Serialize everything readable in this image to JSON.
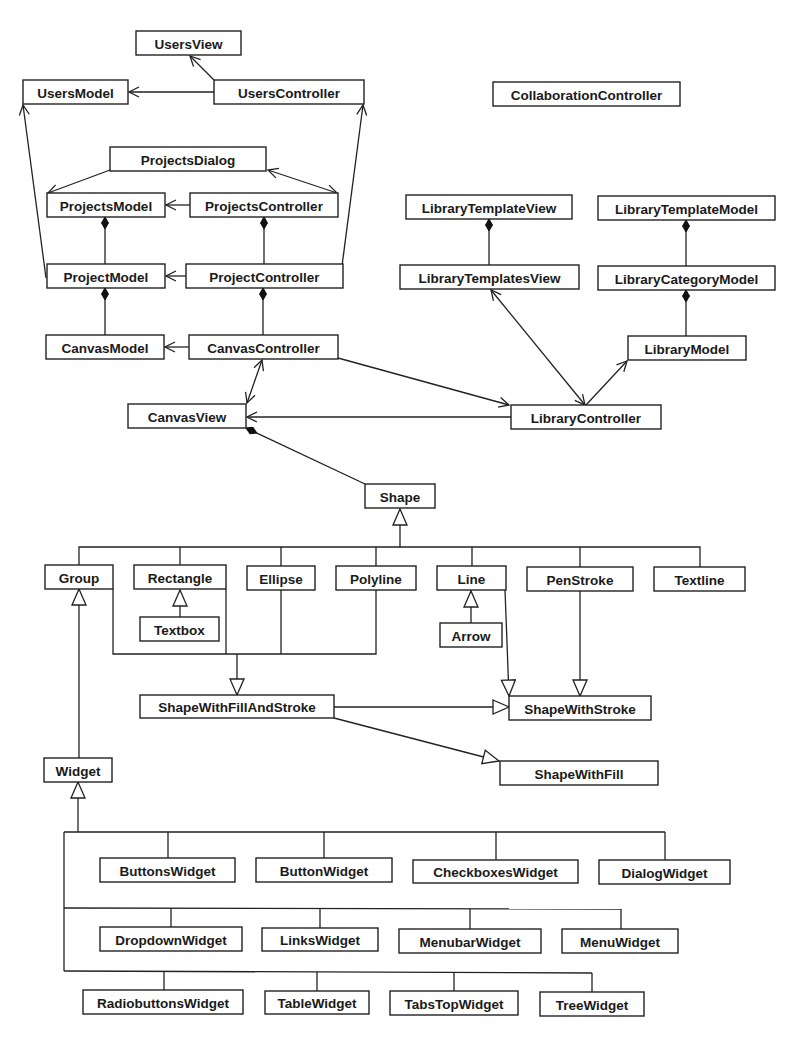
{
  "diagram": {
    "colors": {
      "line": "#222222",
      "box_fill": "#ffffff",
      "text": "#1a1a1a"
    },
    "classes": [
      {
        "id": "UsersView",
        "label": "UsersView",
        "x": 136,
        "y": 31,
        "w": 105,
        "h": 24
      },
      {
        "id": "UsersModel",
        "label": "UsersModel",
        "x": 23,
        "y": 80,
        "w": 105,
        "h": 24
      },
      {
        "id": "UsersController",
        "label": "UsersController",
        "x": 214,
        "y": 80,
        "w": 150,
        "h": 24
      },
      {
        "id": "CollaborationController",
        "label": "CollaborationController",
        "x": 493,
        "y": 82,
        "w": 187,
        "h": 24
      },
      {
        "id": "ProjectsDialog",
        "label": "ProjectsDialog",
        "x": 110,
        "y": 147,
        "w": 156,
        "h": 24
      },
      {
        "id": "ProjectsModel",
        "label": "ProjectsModel",
        "x": 47,
        "y": 193,
        "w": 118,
        "h": 24
      },
      {
        "id": "ProjectsController",
        "label": "ProjectsController",
        "x": 190,
        "y": 193,
        "w": 148,
        "h": 24
      },
      {
        "id": "LibraryTemplateView",
        "label": "LibraryTemplateView",
        "x": 406,
        "y": 195,
        "w": 166,
        "h": 24
      },
      {
        "id": "LibraryTemplateModel",
        "label": "LibraryTemplateModel",
        "x": 598,
        "y": 196,
        "w": 177,
        "h": 24
      },
      {
        "id": "ProjectModel",
        "label": "ProjectModel",
        "x": 47,
        "y": 264,
        "w": 118,
        "h": 24
      },
      {
        "id": "ProjectController",
        "label": "ProjectController",
        "x": 186,
        "y": 264,
        "w": 157,
        "h": 24
      },
      {
        "id": "LibraryTemplatesView",
        "label": "LibraryTemplatesView",
        "x": 400,
        "y": 265,
        "w": 179,
        "h": 24
      },
      {
        "id": "LibraryCategoryModel",
        "label": "LibraryCategoryModel",
        "x": 598,
        "y": 266,
        "w": 177,
        "h": 24
      },
      {
        "id": "CanvasModel",
        "label": "CanvasModel",
        "x": 46,
        "y": 335,
        "w": 118,
        "h": 24
      },
      {
        "id": "CanvasController",
        "label": "CanvasController",
        "x": 189,
        "y": 335,
        "w": 149,
        "h": 24
      },
      {
        "id": "LibraryModel",
        "label": "LibraryModel",
        "x": 628,
        "y": 336,
        "w": 118,
        "h": 24
      },
      {
        "id": "CanvasView",
        "label": "CanvasView",
        "x": 128,
        "y": 404,
        "w": 118,
        "h": 24
      },
      {
        "id": "LibraryController",
        "label": "LibraryController",
        "x": 511,
        "y": 405,
        "w": 150,
        "h": 24
      },
      {
        "id": "Shape",
        "label": "Shape",
        "x": 365,
        "y": 484,
        "w": 70,
        "h": 24
      },
      {
        "id": "Group",
        "label": "Group",
        "x": 45,
        "y": 565,
        "w": 68,
        "h": 24
      },
      {
        "id": "Rectangle",
        "label": "Rectangle",
        "x": 134,
        "y": 565,
        "w": 92,
        "h": 24
      },
      {
        "id": "Ellipse",
        "label": "Ellipse",
        "x": 247,
        "y": 566,
        "w": 68,
        "h": 24
      },
      {
        "id": "Polyline",
        "label": "Polyline",
        "x": 336,
        "y": 566,
        "w": 80,
        "h": 24
      },
      {
        "id": "Line",
        "label": "Line",
        "x": 437,
        "y": 566,
        "w": 69,
        "h": 24
      },
      {
        "id": "PenStroke",
        "label": "PenStroke",
        "x": 527,
        "y": 567,
        "w": 106,
        "h": 24
      },
      {
        "id": "Textline",
        "label": "Textline",
        "x": 654,
        "y": 567,
        "w": 91,
        "h": 24
      },
      {
        "id": "Textbox",
        "label": "Textbox",
        "x": 140,
        "y": 617,
        "w": 79,
        "h": 24
      },
      {
        "id": "Arrow",
        "label": "Arrow",
        "x": 440,
        "y": 623,
        "w": 62,
        "h": 24
      },
      {
        "id": "ShapeWithFillAndStroke",
        "label": "ShapeWithFillAndStroke",
        "x": 140,
        "y": 695,
        "w": 194,
        "h": 23
      },
      {
        "id": "ShapeWithStroke",
        "label": "ShapeWithStroke",
        "x": 509,
        "y": 696,
        "w": 142,
        "h": 24
      },
      {
        "id": "ShapeWithFill",
        "label": "ShapeWithFill",
        "x": 500,
        "y": 761,
        "w": 158,
        "h": 24
      },
      {
        "id": "Widget",
        "label": "Widget",
        "x": 44,
        "y": 758,
        "w": 68,
        "h": 24
      },
      {
        "id": "ButtonsWidget",
        "label": "ButtonsWidget",
        "x": 100,
        "y": 858,
        "w": 135,
        "h": 24
      },
      {
        "id": "ButtonWidget",
        "label": "ButtonWidget",
        "x": 256,
        "y": 858,
        "w": 136,
        "h": 24
      },
      {
        "id": "CheckboxesWidget",
        "label": "CheckboxesWidget",
        "x": 413,
        "y": 860,
        "w": 165,
        "h": 23
      },
      {
        "id": "DialogWidget",
        "label": "DialogWidget",
        "x": 599,
        "y": 860,
        "w": 131,
        "h": 24
      },
      {
        "id": "DropdownWidget",
        "label": "DropdownWidget",
        "x": 100,
        "y": 927,
        "w": 142,
        "h": 24
      },
      {
        "id": "LinksWidget",
        "label": "LinksWidget",
        "x": 262,
        "y": 928,
        "w": 116,
        "h": 23
      },
      {
        "id": "MenubarWidget",
        "label": "MenubarWidget",
        "x": 399,
        "y": 929,
        "w": 142,
        "h": 24
      },
      {
        "id": "MenuWidget",
        "label": "MenuWidget",
        "x": 562,
        "y": 929,
        "w": 116,
        "h": 24
      },
      {
        "id": "RadiobuttonsWidget",
        "label": "RadiobuttonsWidget",
        "x": 83,
        "y": 990,
        "w": 160,
        "h": 24
      },
      {
        "id": "TableWidget",
        "label": "TableWidget",
        "x": 265,
        "y": 991,
        "w": 104,
        "h": 23
      },
      {
        "id": "TabsTopWidget",
        "label": "TabsTopWidget",
        "x": 390,
        "y": 991,
        "w": 128,
        "h": 24
      },
      {
        "id": "TreeWidget",
        "label": "TreeWidget",
        "x": 540,
        "y": 992,
        "w": 104,
        "h": 24
      }
    ],
    "relationships": [
      {
        "type": "association",
        "from": "UsersController",
        "to": "UsersView"
      },
      {
        "type": "association",
        "from": "UsersController",
        "to": "UsersModel"
      },
      {
        "type": "association",
        "from": "ProjectModel",
        "to": "UsersModel"
      },
      {
        "type": "association",
        "from": "ProjectController",
        "to": "UsersController"
      },
      {
        "type": "association",
        "from": "ProjectsDialog",
        "to": "ProjectsModel"
      },
      {
        "type": "bidirectional",
        "from": "ProjectsDialog",
        "to": "ProjectsController"
      },
      {
        "type": "association",
        "from": "ProjectsController",
        "to": "ProjectsModel"
      },
      {
        "type": "composition",
        "whole": "ProjectsModel",
        "part": "ProjectModel"
      },
      {
        "type": "composition",
        "whole": "ProjectsController",
        "part": "ProjectController"
      },
      {
        "type": "association",
        "from": "ProjectController",
        "to": "ProjectModel"
      },
      {
        "type": "composition",
        "whole": "ProjectModel",
        "part": "CanvasModel"
      },
      {
        "type": "composition",
        "whole": "ProjectController",
        "part": "CanvasController"
      },
      {
        "type": "association",
        "from": "CanvasController",
        "to": "CanvasModel"
      },
      {
        "type": "bidirectional",
        "from": "CanvasController",
        "to": "CanvasView"
      },
      {
        "type": "association",
        "from": "CanvasController",
        "to": "LibraryController"
      },
      {
        "type": "association",
        "from": "LibraryController",
        "to": "CanvasView"
      },
      {
        "type": "composition",
        "whole": "LibraryTemplateView",
        "part": "LibraryTemplatesView"
      },
      {
        "type": "composition",
        "whole": "LibraryTemplateModel",
        "part": "LibraryCategoryModel"
      },
      {
        "type": "composition",
        "whole": "LibraryCategoryModel",
        "part": "LibraryModel"
      },
      {
        "type": "bidirectional",
        "from": "LibraryController",
        "to": "LibraryTemplatesView"
      },
      {
        "type": "association",
        "from": "LibraryController",
        "to": "LibraryModel"
      },
      {
        "type": "composition",
        "whole": "CanvasView",
        "part": "Shape"
      },
      {
        "type": "generalization",
        "children": [
          "Group",
          "Rectangle",
          "Ellipse",
          "Polyline",
          "Line",
          "PenStroke",
          "Textline"
        ],
        "parent": "Shape"
      },
      {
        "type": "generalization",
        "children": [
          "Textbox"
        ],
        "parent": "Rectangle"
      },
      {
        "type": "generalization",
        "children": [
          "Arrow"
        ],
        "parent": "Line"
      },
      {
        "type": "generalization",
        "children": [
          "Group",
          "Rectangle",
          "Ellipse",
          "Polyline"
        ],
        "parent": "ShapeWithFillAndStroke"
      },
      {
        "type": "generalization",
        "children": [
          "Line",
          "PenStroke"
        ],
        "parent": "ShapeWithStroke"
      },
      {
        "type": "generalization",
        "children": [
          "ShapeWithFillAndStroke"
        ],
        "parent": "ShapeWithStroke"
      },
      {
        "type": "generalization",
        "children": [
          "ShapeWithFillAndStroke"
        ],
        "parent": "ShapeWithFill"
      },
      {
        "type": "generalization",
        "children": [
          "Widget"
        ],
        "parent": "Group"
      },
      {
        "type": "generalization",
        "children": [
          "ButtonsWidget",
          "ButtonWidget",
          "CheckboxesWidget",
          "DialogWidget",
          "DropdownWidget",
          "LinksWidget",
          "MenubarWidget",
          "MenuWidget",
          "RadiobuttonsWidget",
          "TableWidget",
          "TabsTopWidget",
          "TreeWidget"
        ],
        "parent": "Widget"
      }
    ]
  }
}
